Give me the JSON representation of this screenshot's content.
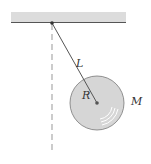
{
  "diagram": {
    "type": "physical-pendulum",
    "labels": {
      "length": "L",
      "radius": "R",
      "mass": "M"
    },
    "colors": {
      "ceiling": "#d9d9d9",
      "ceiling_edge": "#555555",
      "rod": "#555555",
      "disk_fill": "#d4d4d4",
      "disk_stroke": "#777777",
      "dashed_line": "#aaaaaa"
    }
  }
}
